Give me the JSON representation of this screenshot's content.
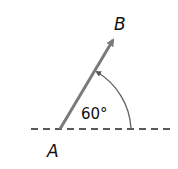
{
  "diagram": {
    "type": "vector-angle",
    "point_start": "A",
    "point_end": "B",
    "angle_label": "60°",
    "angle_degrees": 60,
    "colors": {
      "vector": "#7a7a7a",
      "arc": "#6a6a6a",
      "baseline": "#222222",
      "text": "#111111"
    }
  }
}
